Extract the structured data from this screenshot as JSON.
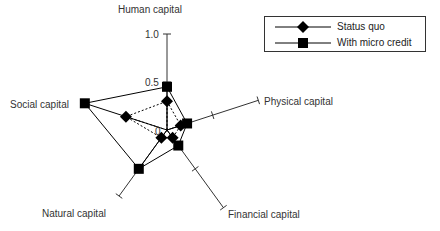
{
  "chart_data": {
    "type": "radar",
    "title": "",
    "axes": [
      "Human capital",
      "Physical capital",
      "Financial capital",
      "Natural capital",
      "Social capital"
    ],
    "scale_labels": {
      "min": "0",
      "mid": "0.5",
      "max": "1.0"
    },
    "range": [
      0,
      1.0
    ],
    "series": [
      {
        "name": "Status quo",
        "marker": "diamond",
        "line": "dotted",
        "values": [
          0.3,
          0.15,
          0.1,
          0.1,
          0.45
        ]
      },
      {
        "name": "With micro credit",
        "marker": "square",
        "line": "solid",
        "values": [
          0.45,
          0.22,
          0.2,
          0.5,
          0.9
        ]
      }
    ],
    "legend_position": "top-right"
  },
  "legend": {
    "items": [
      {
        "label": "Status quo"
      },
      {
        "label": "With micro credit"
      }
    ]
  },
  "axis_labels": {
    "human": "Human capital",
    "physical": "Physical capital",
    "financial": "Financial capital",
    "natural": "Natural capital",
    "social": "Social capital",
    "tick_0": "0",
    "tick_05": "0.5",
    "tick_10": "1.0"
  }
}
